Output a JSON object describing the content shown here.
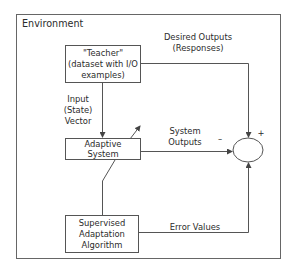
{
  "diagram": {
    "environment_label": "Environment",
    "nodes": {
      "teacher": {
        "line1": "\"Teacher\"",
        "line2": "(dataset with I/O",
        "line3": "examples)"
      },
      "adaptive_system": {
        "line1": "Adaptive",
        "line2": "System"
      },
      "algorithm": {
        "line1": "Supervised",
        "line2": "Adaptation",
        "line3": "Algorithm"
      },
      "summing_junction": {
        "plus_sign": "+",
        "minus_sign": "–"
      }
    },
    "edges": {
      "input_vector": {
        "line1": "Input",
        "line2": "(State)",
        "line3": "Vector"
      },
      "desired_outputs": {
        "line1": "Desired Outputs",
        "line2": "(Responses)"
      },
      "system_outputs": {
        "line1": "System",
        "line2": "Outputs"
      },
      "error_values": {
        "line1": "Error Values"
      }
    },
    "colors": {
      "line": "#555555",
      "frame": "#666666",
      "text": "#2b2b2b",
      "background": "#ffffff"
    }
  }
}
